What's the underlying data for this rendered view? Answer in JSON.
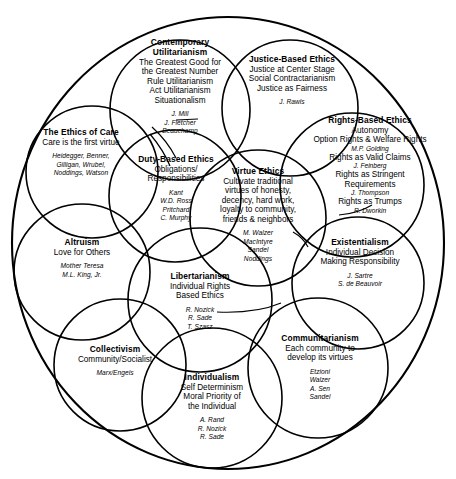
{
  "diagram": {
    "type": "venn-overlapping-circles",
    "title_visible": false,
    "stroke_color": "#000000",
    "background_color": "#ffffff",
    "nodes": [
      {
        "id": "contemporary-utilitarianism",
        "title": "Contemporary\nUtilitarianism",
        "title_lines": [
          "Contemporary",
          "Utilitarianism"
        ],
        "desc_lines": [
          "The Greatest Good for",
          "the Greatest Number",
          "Rule Utilitarianism",
          "Act Utilitarianism",
          "Situationalism"
        ],
        "names": [
          "J. Mill",
          "J. Fletcher",
          "Beauchamp"
        ]
      },
      {
        "id": "justice-based-ethics",
        "title_lines": [
          "Justice-Based Ethics"
        ],
        "desc_lines": [
          "Justice at Center Stage",
          "Social Contractarianism",
          "Justice as Fairness"
        ],
        "names": [
          "J. Rawls"
        ]
      },
      {
        "id": "rights-based-ethics",
        "title_lines": [
          "Rights-Based Ethics"
        ],
        "desc_lines": [
          "Autonomy",
          "Option Rights & Welfare Rights"
        ],
        "interleaved": [
          {
            "text": "M.P. Golding",
            "style": "italic"
          },
          {
            "text": "Rights as Valid Claims",
            "style": "normal"
          },
          {
            "text": "J. Feinberg",
            "style": "italic"
          },
          {
            "text": "Rights as Stringent",
            "style": "normal"
          },
          {
            "text": "Requirements",
            "style": "normal"
          },
          {
            "text": "J. Thompson",
            "style": "italic"
          },
          {
            "text": "Rights as Trumps",
            "style": "normal"
          },
          {
            "text": "R. Dworkin",
            "style": "italic"
          }
        ],
        "names": []
      },
      {
        "id": "ethics-of-care",
        "title_lines": [
          "The Ethics of Care"
        ],
        "desc_lines": [
          "Care is the first virtue"
        ],
        "names": [
          "Heidegger, Benner,",
          "Gilligan, Wrubel,",
          "Noddings, Watson"
        ]
      },
      {
        "id": "duty-based-ethics",
        "title_lines": [
          "Duty-Based Ethics"
        ],
        "desc_lines": [
          "Obligations/",
          "Responsibilities"
        ],
        "names": [
          "Kant",
          "W.D. Ross",
          "Pritchard",
          "C. Murphy"
        ]
      },
      {
        "id": "virtue-ethics",
        "title_lines": [
          "Virtue Ethics"
        ],
        "desc_lines": [
          "Cultivate traditional",
          "virtues of honesty,",
          "decency, hard work,",
          "loyalty to community,",
          "friends & neighbors"
        ],
        "names": [
          "M. Walzer",
          "MacIntyre",
          "Sandel",
          "Noddings"
        ]
      },
      {
        "id": "existentialism",
        "title_lines": [
          "Existentialism"
        ],
        "desc_lines": [
          "Individual Decision",
          "Making Responsibility"
        ],
        "names": [
          "J. Sartre",
          "S. de Beauvoir"
        ]
      },
      {
        "id": "altruism",
        "title_lines": [
          "Altruism"
        ],
        "desc_lines": [
          "Love for Others"
        ],
        "names": [
          "Mother Teresa",
          "M.L. King, Jr."
        ]
      },
      {
        "id": "libertarianism",
        "title_lines": [
          "Libertarianism"
        ],
        "desc_lines": [
          "Individual Rights",
          "Based Ethics"
        ],
        "names": [
          "R. Nozick",
          "R. Sade",
          "T. Szasz"
        ]
      },
      {
        "id": "communitarianism",
        "title_lines": [
          "Communitarianism"
        ],
        "desc_lines": [
          "Each community to",
          "develop its virtues"
        ],
        "names": [
          "Etzioni",
          "Walzer",
          "A. Sen",
          "Sandel"
        ]
      },
      {
        "id": "collectivism",
        "title_lines": [
          "Collectivism"
        ],
        "desc_lines": [
          "Community/Socialist"
        ],
        "names": [
          "Marx/Engels"
        ]
      },
      {
        "id": "individualism",
        "title_lines": [
          "Individualism"
        ],
        "desc_lines": [
          "Self Determinism",
          "Moral Priority of",
          "the Individual"
        ],
        "names": [
          "A. Rand",
          "R. Nozick",
          "R. Sade"
        ]
      }
    ]
  },
  "contemporary_utilitarianism": {
    "t1": "Contemporary",
    "t2": "Utilitarianism",
    "d1": "The Greatest Good for",
    "d2": "the Greatest Number",
    "d3": "Rule Utilitarianism",
    "d4": "Act Utilitarianism",
    "d5": "Situationalism",
    "n1": "J. Mill",
    "n2": "J. Fletcher",
    "n3": "Beauchamp"
  },
  "justice_based_ethics": {
    "t1": "Justice-Based Ethics",
    "d1": "Justice at Center Stage",
    "d2": "Social Contractarianism",
    "d3": "Justice as Fairness",
    "n1": "J. Rawls"
  },
  "rights_based_ethics": {
    "t1": "Rights-Based Ethics",
    "d1": "Autonomy",
    "d2": "Option Rights & Welfare Rights",
    "n1": "M.P. Golding",
    "d3": "Rights as Valid Claims",
    "n2": "J. Feinberg",
    "d4": "Rights as Stringent",
    "d5": "Requirements",
    "n3": "J. Thompson",
    "d6": "Rights as Trumps",
    "n4": "R. Dworkin"
  },
  "ethics_of_care": {
    "t1": "The Ethics of Care",
    "d1": "Care is the first virtue",
    "n1": "Heidegger, Benner,",
    "n2": "Gilligan, Wrubel,",
    "n3": "Noddings, Watson"
  },
  "duty_based_ethics": {
    "t1": "Duty-Based Ethics",
    "d1": "Obligations/",
    "d2": "Responsibilities",
    "n1": "Kant",
    "n2": "W.D. Ross",
    "n3": "Pritchard",
    "n4": "C. Murphy"
  },
  "virtue_ethics": {
    "t1": "Virtue Ethics",
    "d1": "Cultivate traditional",
    "d2": "virtues of honesty,",
    "d3": "decency, hard work,",
    "d4": "loyalty to community,",
    "d5": "friends & neighbors",
    "n1": "M. Walzer",
    "n2": "MacIntyre",
    "n3": "Sandel",
    "n4": "Noddings"
  },
  "existentialism": {
    "t1": "Existentialism",
    "d1": "Individual Decision",
    "d2": "Making Responsibility",
    "n1": "J. Sartre",
    "n2": "S. de Beauvoir"
  },
  "altruism": {
    "t1": "Altruism",
    "d1": "Love for Others",
    "n1": "Mother Teresa",
    "n2": "M.L. King, Jr."
  },
  "libertarianism": {
    "t1": "Libertarianism",
    "d1": "Individual Rights",
    "d2": "Based Ethics",
    "n1": "R. Nozick",
    "n2": "R. Sade",
    "n3": "T. Szasz"
  },
  "communitarianism": {
    "t1": "Communitarianism",
    "d1": "Each community to",
    "d2": "develop its virtues",
    "n1": "Etzioni",
    "n2": "Walzer",
    "n3": "A. Sen",
    "n4": "Sandel"
  },
  "collectivism": {
    "t1": "Collectivism",
    "d1": "Community/Socialist",
    "n1": "Marx/Engels"
  },
  "individualism": {
    "t1": "Individualism",
    "d1": "Self Determinism",
    "d2": "Moral Priority of",
    "d3": "the Individual",
    "n1": "A. Rand",
    "n2": "R. Nozick",
    "n3": "R. Sade"
  }
}
